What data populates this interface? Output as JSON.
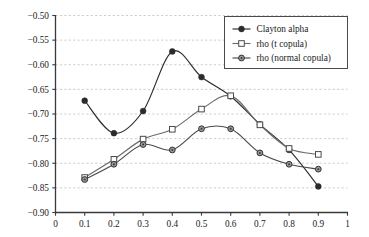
{
  "chart_data": {
    "type": "line",
    "title": "",
    "subtitle": "",
    "xlabel": "",
    "ylabel": "",
    "xlim": [
      0,
      1
    ],
    "ylim": [
      -0.9,
      -0.5
    ],
    "grid": true,
    "grid_axis": "y",
    "legend_position": "top-right",
    "x": [
      0.1,
      0.2,
      0.3,
      0.4,
      0.5,
      0.6,
      0.7,
      0.8,
      0.9
    ],
    "xticks": [
      "0",
      "0.1",
      "0.2",
      "0.3",
      "0.4",
      "0.5",
      "0.6",
      "0.7",
      "0.8",
      "0.9",
      "1"
    ],
    "xtick_values": [
      0,
      0.1,
      0.2,
      0.3,
      0.4,
      0.5,
      0.6,
      0.7,
      0.8,
      0.9,
      1
    ],
    "yticks": [
      "−0.50",
      "−0.55",
      "−0.60",
      "−0.65",
      "−0.70",
      "−0.75",
      "−0.80",
      "−0.85",
      "−0.90"
    ],
    "ytick_values": [
      -0.5,
      -0.55,
      -0.6,
      -0.65,
      -0.7,
      -0.75,
      -0.8,
      -0.85,
      -0.9
    ],
    "series": [
      {
        "name": "Clayton alpha",
        "marker": "filled-circle",
        "color": "#2b2b2b",
        "values": [
          -0.673,
          -0.739,
          -0.694,
          -0.573,
          -0.625,
          -0.664,
          -0.721,
          -0.773,
          -0.847
        ]
      },
      {
        "name": "rho (t copula)",
        "marker": "open-square",
        "color": "#6b6b6b",
        "values": [
          -0.829,
          -0.792,
          -0.751,
          -0.731,
          -0.69,
          -0.663,
          -0.722,
          -0.77,
          -0.782
        ]
      },
      {
        "name": "rho (normal copula)",
        "marker": "ring-circle",
        "color": "#4a4a4a",
        "values": [
          -0.833,
          -0.802,
          -0.762,
          -0.773,
          -0.73,
          -0.73,
          -0.779,
          -0.802,
          -0.812
        ]
      }
    ]
  },
  "legend": {
    "entries": [
      {
        "label": "Clayton alpha"
      },
      {
        "label": "rho (t copula)"
      },
      {
        "label": "rho (normal copula)"
      }
    ]
  },
  "colors": {
    "axis": "#3a3a3a",
    "grid": "#b9b4bd",
    "background": "#ffffff",
    "text": "#1a1a1a"
  }
}
